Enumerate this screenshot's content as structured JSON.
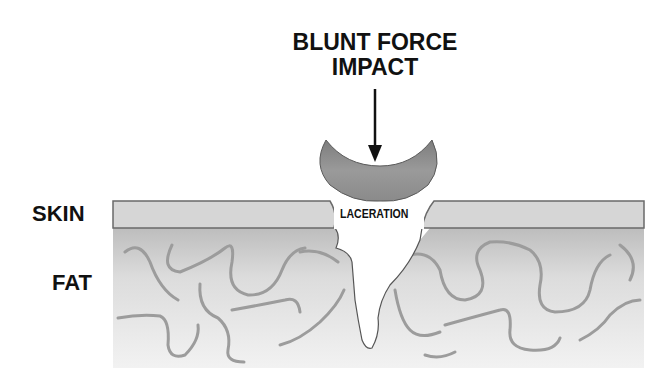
{
  "diagram": {
    "title_lines": [
      "BLUNT FORCE",
      "IMPACT"
    ],
    "labels": {
      "skin": "SKIN",
      "fat": "FAT",
      "laceration": "LACERATION"
    },
    "elements": {
      "impactor": "crescent-shaped blunt object",
      "arrow": "downward force arrow",
      "skin_layer": "skin band",
      "fat_layer": "fat tissue with wavy fibers",
      "wound": "laceration tear through skin into fat"
    },
    "colors": {
      "text": "#111111",
      "impactor": "#8a8a8a",
      "skin": "#d8d8d8",
      "skin_border": "#6a6a6a",
      "fat_top": "#c4c4c4",
      "fat_bottom": "#efefef",
      "fiber": "#9a9a9a"
    }
  }
}
